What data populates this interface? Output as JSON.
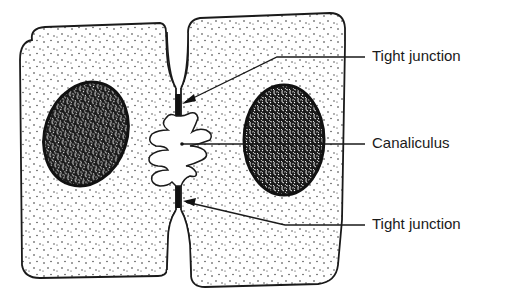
{
  "diagram": {
    "type": "cell-junction-illustration",
    "labels": {
      "tight_junction_top": "Tight junction",
      "canaliculus": "Canaliculus",
      "tight_junction_bottom": "Tight junction"
    },
    "elements": [
      {
        "id": "left-cell",
        "kind": "cell",
        "fill": "stippled"
      },
      {
        "id": "right-cell",
        "kind": "cell",
        "fill": "stippled"
      },
      {
        "id": "left-nucleus",
        "kind": "nucleus",
        "fill": "dense-reticulated"
      },
      {
        "id": "right-nucleus",
        "kind": "nucleus",
        "fill": "dense-reticulated"
      },
      {
        "id": "canaliculus",
        "kind": "lumen",
        "shape": "convoluted microvilli outline"
      },
      {
        "id": "tight-junction-top",
        "kind": "junction"
      },
      {
        "id": "tight-junction-bottom",
        "kind": "junction"
      }
    ],
    "colors": {
      "ink": "#1a1a1a",
      "background": "#ffffff"
    }
  }
}
